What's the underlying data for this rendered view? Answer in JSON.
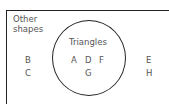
{
  "diagram": {
    "type": "venn",
    "universal_set_label_line1": "Other",
    "universal_set_label_line2": "shapes",
    "set_label": "Triangles",
    "inside": [
      "A",
      "D",
      "F",
      "G"
    ],
    "outside_left": [
      "B",
      "C"
    ],
    "outside_right": [
      "E",
      "H"
    ]
  }
}
